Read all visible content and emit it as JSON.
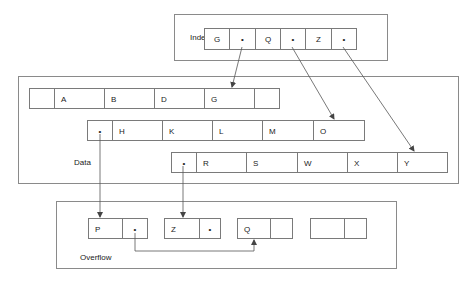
{
  "index": {
    "label": "Index",
    "cells": [
      "G",
      "•",
      "Q",
      "•",
      "Z",
      "•"
    ]
  },
  "data": {
    "label": "Data",
    "row1": [
      "",
      "A",
      "B",
      "D",
      "G",
      ""
    ],
    "row2": [
      "•",
      "H",
      "K",
      "L",
      "M",
      "O"
    ],
    "row3": [
      "•",
      "R",
      "S",
      "W",
      "X",
      "Y"
    ]
  },
  "overflow": {
    "label": "Overflow",
    "records": [
      [
        "P",
        "•"
      ],
      [
        "Z",
        "•"
      ],
      [
        "Q",
        ""
      ],
      [
        "",
        ""
      ]
    ]
  },
  "colors": {
    "line": "#7a7a7a",
    "text": "#222222"
  }
}
